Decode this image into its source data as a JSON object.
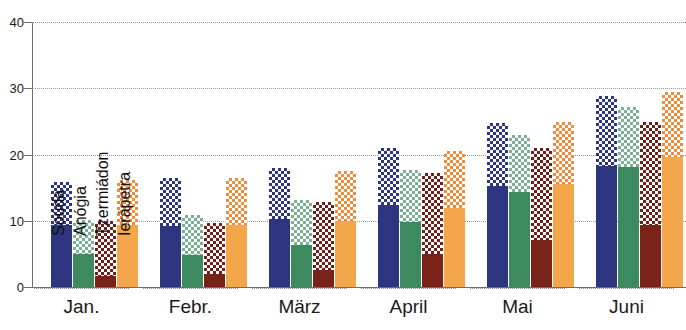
{
  "chart_data": {
    "type": "bar",
    "title": "",
    "subtitle": "",
    "xlabel": "",
    "ylabel": "",
    "ylim": [
      0,
      40
    ],
    "yticks": [
      0,
      10,
      20,
      30,
      40
    ],
    "grid": true,
    "legend_position": "in-plot-rotated-first-group",
    "note": "Each bar is drawn in two segments: a solid lower segment and a checkered upper segment reaching the total value.",
    "categories": [
      "Jan.",
      "Febr.",
      "März",
      "April",
      "Mai",
      "Juni"
    ],
    "series": [
      {
        "name": "Soúda",
        "color": "#2e3580",
        "pattern": "checker",
        "values": [
          15.8,
          16.5,
          18.0,
          21.0,
          24.8,
          28.8
        ],
        "solid_values": [
          9.3,
          9.2,
          10.2,
          12.4,
          15.2,
          18.3
        ]
      },
      {
        "name": "Anógia",
        "color": "#3d8a5f",
        "pattern": "checker",
        "values": [
          10.1,
          10.9,
          13.2,
          17.6,
          22.9,
          27.2
        ],
        "solid_values": [
          5.0,
          4.9,
          6.3,
          9.8,
          14.4,
          18.1
        ]
      },
      {
        "name": "Tzermiádon",
        "color": "#7a2218",
        "pattern": "checker",
        "values": [
          10.0,
          9.6,
          12.9,
          17.2,
          21.0,
          24.9
        ],
        "solid_values": [
          1.6,
          1.9,
          2.5,
          5.0,
          7.1,
          9.4
        ]
      },
      {
        "name": "Ierápetra",
        "color": "#f4a64a",
        "pattern": "checker",
        "values": [
          16.1,
          16.4,
          17.5,
          20.5,
          24.9,
          29.4
        ],
        "solid_values": [
          9.4,
          9.3,
          10.0,
          12.0,
          15.5,
          19.6
        ]
      }
    ]
  },
  "axis": {
    "y_tick_labels": [
      "0",
      "10",
      "20",
      "30",
      "40"
    ]
  }
}
